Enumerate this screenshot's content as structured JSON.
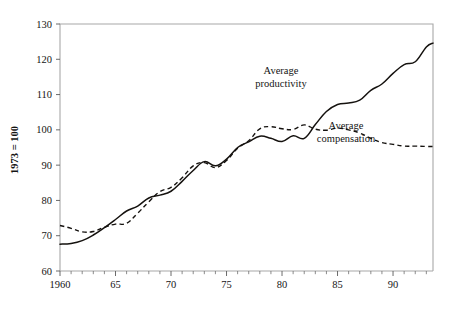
{
  "chart_data": {
    "type": "line",
    "title": "",
    "xlabel": "",
    "ylabel": "1973 = 100",
    "xlim": [
      1960,
      1993.6
    ],
    "ylim": [
      60,
      130
    ],
    "grid": false,
    "legend_position": "inline-annotation",
    "y_ticks": [
      60,
      70,
      80,
      90,
      100,
      110,
      120,
      130
    ],
    "y_tick_labels": [
      "60",
      "70",
      "80",
      "90",
      "100",
      "110",
      "120",
      "130"
    ],
    "x_ticks": [
      1960,
      1965,
      1970,
      1975,
      1980,
      1985,
      1990
    ],
    "x_tick_labels": [
      "1960",
      "65",
      "70",
      "75",
      "80",
      "85",
      "90"
    ],
    "x_minor_tick_interval": 1,
    "x": [
      1960,
      1961,
      1962,
      1963,
      1964,
      1965,
      1966,
      1967,
      1968,
      1969,
      1970,
      1971,
      1972,
      1973,
      1974,
      1975,
      1976,
      1977,
      1978,
      1979,
      1980,
      1981,
      1982,
      1983,
      1984,
      1985,
      1986,
      1987,
      1988,
      1989,
      1990,
      1991,
      1992,
      1993,
      1993.6
    ],
    "series": [
      {
        "name": "Average productivity",
        "style": "solid",
        "annotation": "Average\nproductivity",
        "values": [
          67.6,
          67.8,
          68.6,
          70.2,
          72.3,
          74.6,
          77.0,
          78.4,
          80.7,
          81.5,
          82.6,
          85.4,
          88.5,
          91.0,
          89.8,
          91.7,
          95.0,
          96.6,
          98.2,
          97.6,
          96.7,
          98.3,
          97.6,
          101.5,
          105.2,
          107.2,
          107.6,
          108.4,
          111.2,
          113.0,
          116.0,
          118.5,
          119.3,
          123.5,
          124.6
        ]
      },
      {
        "name": "Average compensation",
        "style": "dashed",
        "annotation": "Average\ncompensation",
        "values": [
          72.9,
          72.1,
          71.1,
          71.2,
          72.4,
          73.3,
          73.5,
          76.4,
          79.6,
          82.5,
          83.7,
          86.4,
          89.8,
          90.7,
          89.3,
          91.3,
          94.8,
          96.9,
          100.3,
          100.9,
          100.3,
          100.1,
          101.4,
          100.2,
          99.9,
          100.5,
          100.0,
          99.1,
          97.6,
          96.4,
          95.9,
          95.4,
          95.4,
          95.3,
          95.3
        ]
      }
    ],
    "annotations": [
      {
        "text_line1": "Average",
        "text_line2": "productivity",
        "x_px": 281,
        "y_px": 74
      },
      {
        "text_line1": "Average",
        "text_line2": "compensation",
        "x_px": 346,
        "y_px": 129
      }
    ]
  }
}
